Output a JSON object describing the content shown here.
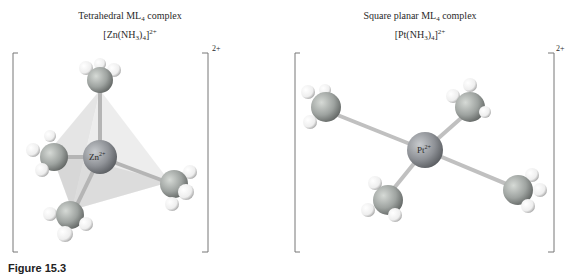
{
  "figure": {
    "caption": "Figure 15.3",
    "panels": [
      {
        "id": "tetrahedral",
        "title": "Tetrahedral ML",
        "title_sub": "4",
        "title_suffix": " complex",
        "formula_prefix": "[Zn(NH",
        "formula_sub1": "3",
        "formula_mid": ")",
        "formula_sub2": "4",
        "formula_end": "]",
        "formula_charge": "2+",
        "bracket_charge": "2+",
        "center_label": "Zn",
        "center_charge": "2+",
        "ligand": "NH3",
        "geometry": "tetrahedral"
      },
      {
        "id": "square-planar",
        "title": "Square planar ML",
        "title_sub": "4",
        "title_suffix": " complex",
        "formula_prefix": "[Pt(NH",
        "formula_sub1": "3",
        "formula_mid": ")",
        "formula_sub2": "4",
        "formula_end": "]",
        "formula_charge": "2+",
        "bracket_charge": "2+",
        "center_label": "Pt",
        "center_charge": "2+",
        "ligand": "NH3",
        "geometry": "square planar"
      }
    ],
    "colors": {
      "metal": "#8e9196",
      "nitrogen": "#9ea3a0",
      "hydrogen": "#f2f2f2",
      "bond": "#c8c8c8",
      "tetrahedron_fill": "#d8d8d8",
      "bracket": "#777777"
    }
  }
}
